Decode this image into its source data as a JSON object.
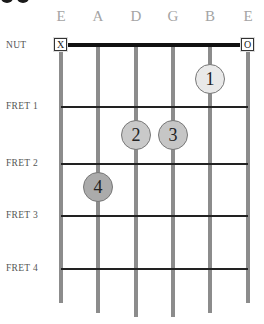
{
  "diagram": {
    "type": "guitar-chord-chart",
    "strings": [
      {
        "label": "E",
        "x": 61,
        "bottom": 303,
        "marker": "X"
      },
      {
        "label": "A",
        "x": 98,
        "bottom": 313,
        "marker": ""
      },
      {
        "label": "D",
        "x": 136,
        "bottom": 317,
        "marker": ""
      },
      {
        "label": "G",
        "x": 173,
        "bottom": 317,
        "marker": ""
      },
      {
        "label": "B",
        "x": 210,
        "bottom": 313,
        "marker": ""
      },
      {
        "label": "E",
        "x": 248,
        "bottom": 303,
        "marker": "O"
      }
    ],
    "nut_label": "NUT",
    "frets": [
      {
        "label": "FRET 1",
        "y": 107
      },
      {
        "label": "FRET 2",
        "y": 164
      },
      {
        "label": "FRET 3",
        "y": 216
      },
      {
        "label": "FRET 4",
        "y": 269
      }
    ],
    "fingers": [
      {
        "number": "1",
        "string": "B",
        "fret": "open-to-1",
        "x": 210,
        "y": 79,
        "color": "#e9e9e9"
      },
      {
        "number": "2",
        "string": "D",
        "fret": 1,
        "x": 136,
        "y": 135,
        "color": "#c9c9c9"
      },
      {
        "number": "3",
        "string": "G",
        "fret": 1,
        "x": 173,
        "y": 135,
        "color": "#c6c6c6"
      },
      {
        "number": "4",
        "string": "A",
        "fret": 2,
        "x": 98,
        "y": 187,
        "color": "#ababab"
      }
    ],
    "colors": {
      "string": "#8c8c8c",
      "fret": "#222222",
      "nut": "#111111",
      "string_label": "#a4a4a4"
    }
  }
}
